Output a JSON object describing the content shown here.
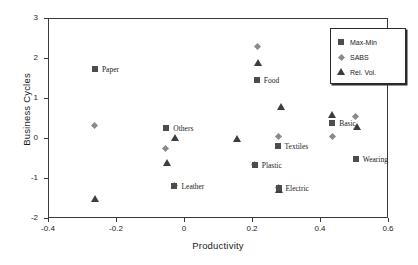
{
  "chart_data": {
    "type": "scatter",
    "title": "",
    "xlabel": "Productivity",
    "ylabel": "Business Cycles",
    "xlim": [
      -0.4,
      0.6
    ],
    "ylim": [
      -2,
      3
    ],
    "xticks": [
      "-0.4",
      "-0.2",
      "0",
      "0.2",
      "0.4",
      "0.6"
    ],
    "xtick_values": [
      -0.4,
      -0.2,
      0,
      0.2,
      0.4,
      0.6
    ],
    "yticks": [
      "3",
      "2",
      "1",
      "0",
      "-1",
      "-2"
    ],
    "ytick_values": [
      3,
      2,
      1,
      0,
      -1,
      -2
    ],
    "grid": false,
    "legend_position": "top-right",
    "series": [
      {
        "name": "Max-Min",
        "marker": "square",
        "color": "#4d4d4d",
        "points": [
          {
            "x": -0.262,
            "y": 1.72,
            "label": "Paper"
          },
          {
            "x": -0.052,
            "y": 0.25,
            "label": "Others"
          },
          {
            "x": -0.028,
            "y": -1.19,
            "label": "Leather"
          },
          {
            "x": 0.214,
            "y": 1.45,
            "label": "Food"
          },
          {
            "x": 0.208,
            "y": -0.67,
            "label": "Plastic"
          },
          {
            "x": 0.275,
            "y": -0.2,
            "label": "Textiles"
          },
          {
            "x": 0.278,
            "y": -1.24,
            "label": "Electric"
          },
          {
            "x": 0.436,
            "y": 0.37,
            "label": "Basic"
          },
          {
            "x": 0.505,
            "y": -0.52,
            "label": "Wearing"
          }
        ]
      },
      {
        "name": "SABS",
        "marker": "diamond",
        "color": "#8a8a8a",
        "points": [
          {
            "x": -0.263,
            "y": 0.32,
            "label": ""
          },
          {
            "x": -0.055,
            "y": -0.25,
            "label": ""
          },
          {
            "x": -0.028,
            "y": -1.19,
            "label": ""
          },
          {
            "x": 0.215,
            "y": 2.3,
            "label": ""
          },
          {
            "x": 0.208,
            "y": -0.67,
            "label": ""
          },
          {
            "x": 0.278,
            "y": 0.03,
            "label": ""
          },
          {
            "x": 0.278,
            "y": -1.24,
            "label": ""
          },
          {
            "x": 0.436,
            "y": 0.05,
            "label": ""
          },
          {
            "x": 0.505,
            "y": 0.55,
            "label": ""
          }
        ]
      },
      {
        "name": "Rel. Vol.",
        "marker": "triangle",
        "color": "#3d3d3d",
        "points": [
          {
            "x": -0.262,
            "y": -1.52,
            "label": ""
          },
          {
            "x": -0.026,
            "y": 0.0,
            "label": ""
          },
          {
            "x": -0.05,
            "y": -0.63,
            "label": ""
          },
          {
            "x": 0.155,
            "y": -0.02,
            "label": ""
          },
          {
            "x": 0.217,
            "y": 1.87,
            "label": ""
          },
          {
            "x": 0.286,
            "y": 0.77,
            "label": ""
          },
          {
            "x": 0.278,
            "y": -1.3,
            "label": ""
          },
          {
            "x": 0.434,
            "y": 0.57,
            "label": ""
          },
          {
            "x": 0.508,
            "y": 0.28,
            "label": ""
          }
        ]
      }
    ],
    "point_labels": [
      {
        "text": "Paper",
        "x": -0.262,
        "y": 1.72,
        "dx": 7,
        "dy": 0
      },
      {
        "text": "Others",
        "x": -0.052,
        "y": 0.25,
        "dx": 7,
        "dy": 0
      },
      {
        "text": "Leather",
        "x": -0.028,
        "y": -1.19,
        "dx": 7,
        "dy": 0
      },
      {
        "text": "Food",
        "x": 0.214,
        "y": 1.45,
        "dx": 7,
        "dy": 0
      },
      {
        "text": "Plastic",
        "x": 0.208,
        "y": -0.67,
        "dx": 7,
        "dy": 0
      },
      {
        "text": "Textiles",
        "x": 0.275,
        "y": -0.2,
        "dx": 7,
        "dy": 0
      },
      {
        "text": "Electric",
        "x": 0.278,
        "y": -1.24,
        "dx": 7,
        "dy": 0
      },
      {
        "text": "Basic",
        "x": 0.436,
        "y": 0.37,
        "dx": 7,
        "dy": 0
      },
      {
        "text": "Wearing",
        "x": 0.505,
        "y": -0.52,
        "dx": 7,
        "dy": 0
      }
    ]
  },
  "legend": {
    "entries": [
      {
        "label": "Max-Min",
        "marker": "square"
      },
      {
        "label": "SABS",
        "marker": "diamond"
      },
      {
        "label": "Rel. Vol.",
        "marker": "triangle"
      }
    ]
  }
}
